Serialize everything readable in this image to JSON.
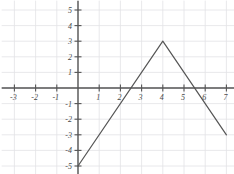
{
  "chart_data": {
    "type": "line",
    "title": "",
    "subtitle": "",
    "xlabel": "",
    "ylabel": "",
    "xlim": [
      -3.6,
      7.6
    ],
    "ylim": [
      -5.6,
      5.6
    ],
    "xticks": [
      -3,
      -2,
      -1,
      1,
      2,
      3,
      4,
      5,
      6,
      7
    ],
    "yticks": [
      -5,
      -4,
      -3,
      -2,
      -1,
      1,
      2,
      3,
      4,
      5
    ],
    "xtick_labels": [
      "-3",
      "-2",
      "-1",
      "1",
      "2",
      "3",
      "4",
      "5",
      "6",
      "7"
    ],
    "ytick_labels": [
      "-5",
      "-4",
      "-3",
      "-2",
      "-1",
      "1",
      "2",
      "3",
      "4",
      "5"
    ],
    "grid": true,
    "legend": null,
    "legend_position": "none",
    "series": [
      {
        "name": "piecewise-linear",
        "points": [
          {
            "x": 0,
            "y": -5
          },
          {
            "x": 4,
            "y": 3
          },
          {
            "x": 7,
            "y": -3
          }
        ],
        "color": "#555555",
        "vertex": {
          "x": 4,
          "y": 3
        },
        "x_intercepts": [
          2.5,
          5.5
        ],
        "y_intercept": -5
      }
    ],
    "annotations": []
  },
  "style": {
    "grid_color": "#e2e2e6",
    "axis_color": "#555555",
    "tick_label_color": "#4a4a4a",
    "curve_color": "#555555",
    "background": "#ffffff"
  }
}
